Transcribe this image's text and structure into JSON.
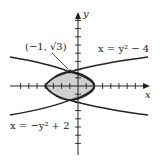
{
  "diagram": {
    "type": "region-between-curves",
    "axes": {
      "x_label": "x",
      "y_label": "y"
    },
    "curves": [
      {
        "label": "x = y² − 4",
        "equation": "x = y^2 - 4"
      },
      {
        "label": "x = −y² + 2",
        "equation": "x = -y^2 + 2"
      }
    ],
    "intersection_label": "(−1, √3)",
    "intersection_point": [
      -1,
      1.732
    ],
    "shaded_region": "between curves, x from -4 to 2",
    "colors": {
      "shade": "#d0d0d0",
      "line": "#222222"
    }
  }
}
